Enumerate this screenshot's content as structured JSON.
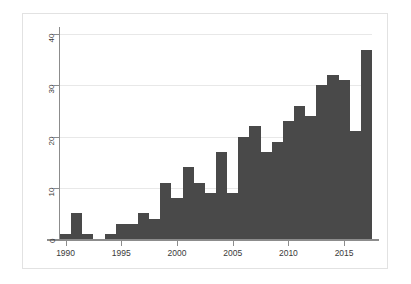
{
  "chart_data": {
    "type": "bar",
    "title": "",
    "subtitle": "",
    "xlabel": "",
    "ylabel": "",
    "legend": [],
    "grid": true,
    "legend_position": "none",
    "bar_color": "#494949",
    "categories": [
      "1990",
      "1991",
      "1992",
      "1993",
      "1994",
      "1995",
      "1996",
      "1997",
      "1998",
      "1999",
      "2000",
      "2001",
      "2002",
      "2003",
      "2004",
      "2005",
      "2006",
      "2007",
      "2008",
      "2009",
      "2010",
      "2011",
      "2012",
      "2013",
      "2014",
      "2015",
      "2016",
      "2017"
    ],
    "values": [
      1,
      5,
      1,
      0,
      1,
      3,
      3,
      5,
      4,
      11,
      8,
      14,
      11,
      9,
      17,
      9,
      20,
      22,
      17,
      19,
      23,
      26,
      24,
      30,
      32,
      31,
      21,
      37
    ],
    "xlim": [
      1989.5,
      1817.5
    ],
    "x_range": [
      1989.5,
      2017.5
    ],
    "ylim": [
      0,
      41
    ],
    "y_ticks": [
      "0",
      "10",
      "20",
      "30",
      "40"
    ],
    "y_tick_values": [
      0,
      10,
      20,
      30,
      40
    ],
    "x_ticks": [
      "1990",
      "1995",
      "2000",
      "2005",
      "2010",
      "2015"
    ],
    "x_tick_values": [
      1990,
      1995,
      2000,
      2005,
      2010,
      2015
    ]
  }
}
